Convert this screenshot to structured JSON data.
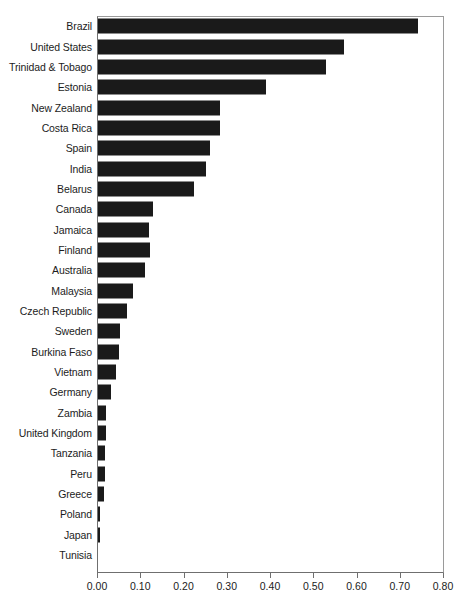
{
  "chart_data": {
    "type": "bar",
    "orientation": "horizontal",
    "title": "",
    "xlabel": "",
    "ylabel": "",
    "xlim": [
      0.0,
      0.8
    ],
    "ylim": null,
    "grid": false,
    "legend": null,
    "bar_color": "#1a1a1a",
    "frame_color": "#6f6f6f",
    "xticks": [
      "0.00",
      "0.10",
      "0.20",
      "0.30",
      "0.40",
      "0.50",
      "0.60",
      "0.70",
      "0.80"
    ],
    "xtick_values": [
      0.0,
      0.1,
      0.2,
      0.3,
      0.4,
      0.5,
      0.6,
      0.7,
      0.8
    ],
    "categories": [
      "Brazil",
      "United States",
      "Trinidad & Tobago",
      "Estonia",
      "New Zealand",
      "Costa Rica",
      "Spain",
      "India",
      "Belarus",
      "Canada",
      "Jamaica",
      "Finland",
      "Australia",
      "Malaysia",
      "Czech Republic",
      "Sweden",
      "Burkina Faso",
      "Vietnam",
      "Germany",
      "Zambia",
      "United Kingdom",
      "Tanzania",
      "Peru",
      "Greece",
      "Poland",
      "Japan",
      "Tunisia"
    ],
    "values": [
      0.74,
      0.568,
      0.528,
      0.388,
      0.283,
      0.283,
      0.26,
      0.249,
      0.222,
      0.128,
      0.117,
      0.121,
      0.108,
      0.08,
      0.068,
      0.052,
      0.049,
      0.042,
      0.03,
      0.019,
      0.018,
      0.016,
      0.016,
      0.015,
      0.005,
      0.004,
      0.0
    ]
  }
}
